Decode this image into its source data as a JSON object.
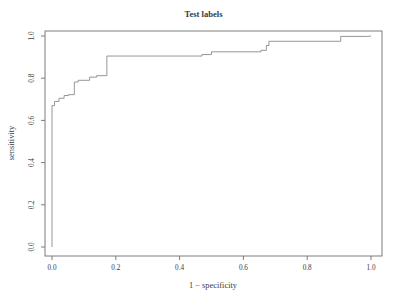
{
  "chart_data": {
    "type": "line",
    "title": "Test labels",
    "xlabel": "1 − specificity",
    "ylabel": "sensitivity",
    "xlim": [
      0.0,
      1.0
    ],
    "ylim": [
      0.0,
      1.0
    ],
    "grid": false,
    "legend": null,
    "xticks": [
      "0.0",
      "0.2",
      "0.4",
      "0.6",
      "0.8",
      "1.0"
    ],
    "xtick_values": [
      0.0,
      0.2,
      0.4,
      0.6,
      0.8,
      1.0
    ],
    "yticks": [
      "0.0",
      "0.2",
      "0.4",
      "0.6",
      "0.8",
      "1.0"
    ],
    "ytick_values": [
      0.0,
      0.2,
      0.4,
      0.6,
      0.8,
      1.0
    ],
    "series": [
      {
        "name": "ROC curve",
        "color": "#8a8a8a",
        "drawstyle": "steps-post",
        "x": [
          0.0,
          0.0,
          0.008,
          0.008,
          0.022,
          0.022,
          0.038,
          0.038,
          0.052,
          0.052,
          0.07,
          0.07,
          0.082,
          0.082,
          0.118,
          0.118,
          0.14,
          0.14,
          0.172,
          0.172,
          0.47,
          0.47,
          0.5,
          0.5,
          0.655,
          0.655,
          0.672,
          0.672,
          0.68,
          0.68,
          0.905,
          0.905,
          0.99,
          1.0
        ],
        "y": [
          0.0,
          0.67,
          0.67,
          0.69,
          0.69,
          0.705,
          0.705,
          0.718,
          0.718,
          0.722,
          0.722,
          0.782,
          0.782,
          0.79,
          0.79,
          0.805,
          0.805,
          0.812,
          0.812,
          0.905,
          0.905,
          0.912,
          0.912,
          0.925,
          0.925,
          0.932,
          0.932,
          0.955,
          0.955,
          0.975,
          0.975,
          0.998,
          0.998,
          1.0
        ]
      }
    ]
  },
  "axes": {
    "title_text": "Test labels",
    "x_axis_title": "1 − specificity",
    "y_axis_title": "sensitivity"
  }
}
